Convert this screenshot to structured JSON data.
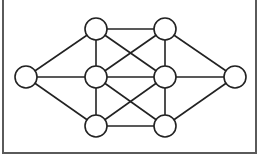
{
  "diagram": {
    "type": "undirected-graph",
    "frame": {
      "left_x": 3,
      "right_x": 256,
      "bottom_y": 153,
      "top_y": 0,
      "open_top": true
    },
    "node_radius": 11,
    "colors": {
      "line": "#222222",
      "node_fill": "#ffffff",
      "frame": "#5a5a5a",
      "background": "#ffffff"
    },
    "nodes": [
      {
        "id": "L",
        "x": 26,
        "y": 77
      },
      {
        "id": "T1",
        "x": 96,
        "y": 29
      },
      {
        "id": "M1",
        "x": 96,
        "y": 77
      },
      {
        "id": "B1",
        "x": 96,
        "y": 126
      },
      {
        "id": "T2",
        "x": 165,
        "y": 29
      },
      {
        "id": "M2",
        "x": 165,
        "y": 77
      },
      {
        "id": "B2",
        "x": 165,
        "y": 126
      },
      {
        "id": "R",
        "x": 235,
        "y": 77
      }
    ],
    "edges": [
      [
        "L",
        "T1"
      ],
      [
        "L",
        "M1"
      ],
      [
        "L",
        "B1"
      ],
      [
        "R",
        "T2"
      ],
      [
        "R",
        "M2"
      ],
      [
        "R",
        "B2"
      ],
      [
        "T1",
        "T2"
      ],
      [
        "T1",
        "M1"
      ],
      [
        "T1",
        "M2"
      ],
      [
        "T2",
        "M1"
      ],
      [
        "T2",
        "M2"
      ],
      [
        "M1",
        "M2"
      ],
      [
        "M1",
        "B1"
      ],
      [
        "M1",
        "B2"
      ],
      [
        "M2",
        "B1"
      ],
      [
        "M2",
        "B2"
      ],
      [
        "B1",
        "B2"
      ]
    ]
  }
}
